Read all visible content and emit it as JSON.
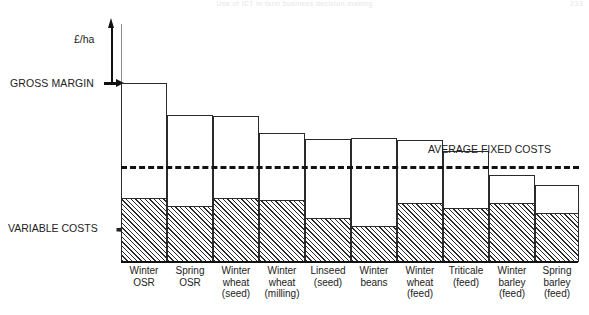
{
  "page_header": {
    "title": "Use of ICT in farm business decision-making",
    "page_number": "233"
  },
  "axis": {
    "y_unit": "£/ha",
    "gross_margin_label": "GROSS MARGIN",
    "variable_costs_label": "VARIABLE COSTS",
    "average_fixed_costs_label": "AVERAGE FIXED COSTS"
  },
  "chart_data": {
    "type": "bar",
    "title": "",
    "subtitle": "",
    "xlabel": "",
    "ylabel": "£/ha",
    "grid": false,
    "legend": false,
    "note": "Stacked column chart: each column total = gross margin; lower hatched portion = variable costs; a dashed horizontal reference line marks average fixed costs. Values are read off pixel heights relative to the baseline (no numeric axis ticks are printed).",
    "categories": [
      "Winter OSR",
      "Spring OSR",
      "Winter wheat (seed)",
      "Winter wheat (milling)",
      "Linseed (seed)",
      "Winter beans",
      "Winter wheat (feed)",
      "Triticale (feed)",
      "Winter barley (feed)",
      "Spring barley (feed)"
    ],
    "category_lines": [
      [
        "Winter",
        "OSR"
      ],
      [
        "Spring",
        "OSR"
      ],
      [
        "Winter",
        "wheat",
        "(seed)"
      ],
      [
        "Winter",
        "wheat",
        "(milling)"
      ],
      [
        "Linseed",
        "(seed)"
      ],
      [
        "Winter",
        "beans"
      ],
      [
        "Winter",
        "wheat",
        "(feed)"
      ],
      [
        "Triticale",
        "(feed)"
      ],
      [
        "Winter",
        "barley",
        "(feed)"
      ],
      [
        "Spring",
        "barley",
        "(feed)"
      ]
    ],
    "series": [
      {
        "name": "Gross margin (total column height)",
        "values": [
          178,
          146,
          145,
          128,
          122,
          123,
          121,
          110,
          86,
          76
        ]
      },
      {
        "name": "Variable costs (hatched lower segment)",
        "values": [
          61,
          53,
          61,
          59,
          41,
          33,
          56,
          51,
          56,
          46
        ]
      }
    ],
    "reference_lines": [
      {
        "name": "average-fixed-costs",
        "label": "AVERAGE FIXED COSTS",
        "value": 94,
        "style": "dashed"
      }
    ],
    "ylim": [
      0,
      200
    ]
  },
  "bars": [
    {
      "key": "winter-osr",
      "left": 0,
      "width": 46,
      "top": 83,
      "vc_top": 200
    },
    {
      "key": "spring-osr",
      "left": 46,
      "width": 46,
      "top": 115,
      "vc_top": 208
    },
    {
      "key": "winter-wheat-seed",
      "left": 92,
      "width": 46,
      "top": 116,
      "vc_top": 200
    },
    {
      "key": "winter-wheat-milling",
      "left": 138,
      "width": 46,
      "top": 133,
      "vc_top": 202
    },
    {
      "key": "linseed-seed",
      "left": 184,
      "width": 46,
      "top": 139,
      "vc_top": 220
    },
    {
      "key": "winter-beans",
      "left": 230,
      "width": 46,
      "top": 138,
      "vc_top": 228
    },
    {
      "key": "winter-wheat-feed",
      "left": 276,
      "width": 46,
      "top": 140,
      "vc_top": 205
    },
    {
      "key": "triticale-feed",
      "left": 322,
      "width": 46,
      "top": 151,
      "vc_top": 210
    },
    {
      "key": "winter-barley-feed",
      "left": 368,
      "width": 46,
      "top": 175,
      "vc_top": 205
    },
    {
      "key": "spring-barley-feed",
      "left": 414,
      "width": 44,
      "top": 185,
      "vc_top": 215
    }
  ],
  "colors": {
    "ink": "#1a1a1a",
    "line": "#2a2a2a",
    "axis": "#8b8b8f",
    "background": "#ffffff"
  }
}
